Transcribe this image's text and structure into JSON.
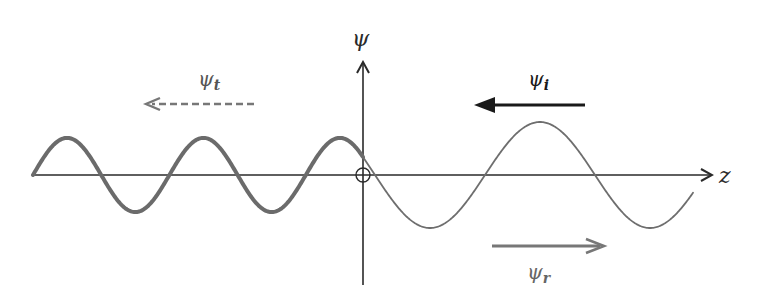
{
  "diagram": {
    "axes": {
      "horizontal_label": "z",
      "vertical_label": "ψ"
    },
    "waves": [
      {
        "id": "transmitted",
        "region": "z < 0",
        "style": "thick",
        "relative_amplitude": 0.7,
        "relative_wavelength": 0.62,
        "color": "#6b6b6b"
      },
      {
        "id": "incident_plus_reflected",
        "region": "z > 0",
        "style": "thin",
        "relative_amplitude": 1.0,
        "relative_wavelength": 1.0,
        "color": "#6e6e6e"
      }
    ],
    "arrows": [
      {
        "id": "incident",
        "label_base": "ψ",
        "label_sub": "i",
        "direction": "left",
        "style": "solid-thick",
        "color": "#1a1a1a"
      },
      {
        "id": "transmitted",
        "label_base": "ψ",
        "label_sub": "t",
        "direction": "left",
        "style": "dashed",
        "color": "#777777"
      },
      {
        "id": "reflected",
        "label_base": "ψ",
        "label_sub": "r",
        "direction": "right",
        "style": "solid",
        "color": "#777777"
      }
    ],
    "origin_marker": "circle-cross",
    "colors": {
      "axis": "#2a2a2a",
      "background": "#ffffff"
    }
  }
}
